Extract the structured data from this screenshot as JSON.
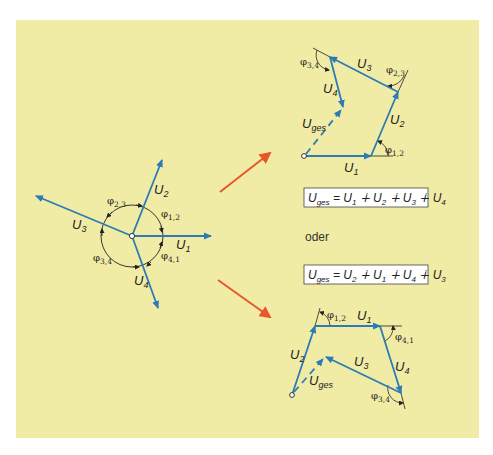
{
  "colors": {
    "background": "#f1eca5",
    "vector": "#2c7bb6",
    "arrow": "#e8562a",
    "line": "#222222",
    "box_fill": "#ffffff"
  },
  "star": {
    "vectors": [
      {
        "name": "U",
        "sub": "1"
      },
      {
        "name": "U",
        "sub": "2"
      },
      {
        "name": "U",
        "sub": "3"
      },
      {
        "name": "U",
        "sub": "4"
      }
    ],
    "angles": [
      {
        "sym": "φ",
        "sub": "1,2"
      },
      {
        "sym": "φ",
        "sub": "2,3"
      },
      {
        "sym": "φ",
        "sub": "3,4"
      },
      {
        "sym": "φ",
        "sub": "4,1"
      }
    ]
  },
  "polygon_top": {
    "vectors": [
      {
        "name": "U",
        "sub": "1"
      },
      {
        "name": "U",
        "sub": "2"
      },
      {
        "name": "U",
        "sub": "3"
      },
      {
        "name": "U",
        "sub": "4"
      }
    ],
    "result": {
      "name": "U",
      "sub": "ges"
    },
    "angles": [
      {
        "sym": "φ",
        "sub": "1,2"
      },
      {
        "sym": "φ",
        "sub": "2,3"
      },
      {
        "sym": "φ",
        "sub": "3,4"
      }
    ]
  },
  "polygon_bottom": {
    "vectors": [
      {
        "name": "U",
        "sub": "1"
      },
      {
        "name": "U",
        "sub": "2"
      },
      {
        "name": "U",
        "sub": "3"
      },
      {
        "name": "U",
        "sub": "4"
      }
    ],
    "result": {
      "name": "U",
      "sub": "ges"
    },
    "angles": [
      {
        "sym": "φ",
        "sub": "1,2"
      },
      {
        "sym": "φ",
        "sub": "4,1"
      },
      {
        "sym": "φ",
        "sub": "3,4"
      }
    ]
  },
  "formulas": [
    {
      "lhs": "U",
      "lhs_sub": "ges",
      "eq": " = ",
      "terms": [
        {
          "name": "U",
          "sub": "1"
        },
        {
          "name": "U",
          "sub": "2"
        },
        {
          "name": "U",
          "sub": "3"
        },
        {
          "name": "U",
          "sub": "4"
        }
      ],
      "op": " ∔ "
    },
    {
      "lhs": "U",
      "lhs_sub": "ges",
      "eq": " = ",
      "terms": [
        {
          "name": "U",
          "sub": "2"
        },
        {
          "name": "U",
          "sub": "1"
        },
        {
          "name": "U",
          "sub": "4"
        },
        {
          "name": "U",
          "sub": "3"
        }
      ],
      "op": " ∔ "
    }
  ],
  "connector_text": "oder"
}
